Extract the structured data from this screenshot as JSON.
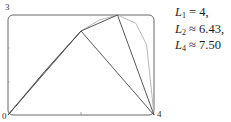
{
  "chart_data": {
    "type": "line",
    "title": "",
    "xlabel": "",
    "ylabel": "",
    "xlim": [
      0,
      4
    ],
    "ylim": [
      0,
      3
    ],
    "grid": false,
    "tick_labels": {
      "x_start": "0",
      "x_end": "4",
      "y_top": "3"
    },
    "series": [
      {
        "name": "curve",
        "style": "smooth gray",
        "x": [
          0,
          0.5,
          1,
          1.5,
          2,
          2.5,
          3,
          3.5,
          3.8,
          4
        ],
        "y": [
          0,
          0.65,
          1.3,
          1.92,
          2.52,
          2.85,
          3.0,
          2.75,
          2.1,
          0
        ]
      },
      {
        "name": "L1",
        "x": [
          0,
          4
        ],
        "y": [
          0,
          0
        ]
      },
      {
        "name": "L2",
        "x": [
          0,
          2,
          4
        ],
        "y": [
          0,
          2.52,
          0
        ]
      },
      {
        "name": "L4",
        "x": [
          0,
          1,
          2,
          3,
          4
        ],
        "y": [
          0,
          1.3,
          2.52,
          3.0,
          0
        ]
      }
    ],
    "annotations": [
      {
        "var": "L",
        "sub": "1",
        "rel": "=",
        "value": "4,"
      },
      {
        "var": "L",
        "sub": "2",
        "rel": "≈",
        "value": "6.43,"
      },
      {
        "var": "L",
        "sub": "4",
        "rel": "≈",
        "value": "7.50"
      }
    ]
  },
  "labels": {
    "origin": "0",
    "x_max": "4",
    "y_max": "3"
  },
  "legend": [
    {
      "var": "L",
      "sub": "1",
      "rel": "=",
      "value": "4,"
    },
    {
      "var": "L",
      "sub": "2",
      "rel": "≈",
      "value": "6.43,"
    },
    {
      "var": "L",
      "sub": "4",
      "rel": "≈",
      "value": "7.50"
    }
  ],
  "colors": {
    "frame": "#555555",
    "curve": "#b0b0b0",
    "segments": "#444444"
  }
}
